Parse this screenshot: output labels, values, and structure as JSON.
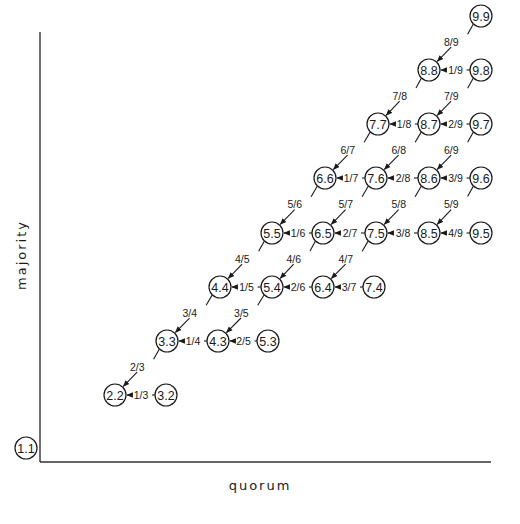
{
  "axes": {
    "x_label": "quorum",
    "y_label": "majority"
  },
  "nodes": [
    {
      "id": "1.1",
      "label": "1.1",
      "x": 26,
      "y": 448
    },
    {
      "id": "2.2",
      "label": "2.2",
      "x": 115,
      "y": 395
    },
    {
      "id": "3.2",
      "label": "3.2",
      "x": 166,
      "y": 395
    },
    {
      "id": "3.3",
      "label": "3.3",
      "x": 167,
      "y": 341
    },
    {
      "id": "4.3",
      "label": "4.3",
      "x": 218,
      "y": 341
    },
    {
      "id": "5.3",
      "label": "5.3",
      "x": 268,
      "y": 341
    },
    {
      "id": "4.4",
      "label": "4.4",
      "x": 220,
      "y": 287
    },
    {
      "id": "5.4",
      "label": "5.4",
      "x": 272,
      "y": 287
    },
    {
      "id": "6.4",
      "label": "6.4",
      "x": 323,
      "y": 287
    },
    {
      "id": "7.4",
      "label": "7.4",
      "x": 374,
      "y": 287
    },
    {
      "id": "5.5",
      "label": "5.5",
      "x": 272,
      "y": 233
    },
    {
      "id": "6.5",
      "label": "6.5",
      "x": 323,
      "y": 233
    },
    {
      "id": "7.5",
      "label": "7.5",
      "x": 376,
      "y": 233
    },
    {
      "id": "8.5",
      "label": "8.5",
      "x": 429,
      "y": 233
    },
    {
      "id": "9.5",
      "label": "9.5",
      "x": 481,
      "y": 233
    },
    {
      "id": "6.6",
      "label": "6.6",
      "x": 325,
      "y": 178
    },
    {
      "id": "7.6",
      "label": "7.6",
      "x": 376,
      "y": 178
    },
    {
      "id": "8.6",
      "label": "8.6",
      "x": 429,
      "y": 178
    },
    {
      "id": "9.6",
      "label": "9.6",
      "x": 481,
      "y": 178
    },
    {
      "id": "7.7",
      "label": "7.7",
      "x": 378,
      "y": 124
    },
    {
      "id": "8.7",
      "label": "8.7",
      "x": 429,
      "y": 124
    },
    {
      "id": "9.7",
      "label": "9.7",
      "x": 481,
      "y": 124
    },
    {
      "id": "8.8",
      "label": "8.8",
      "x": 429,
      "y": 70
    },
    {
      "id": "9.8",
      "label": "9.8",
      "x": 481,
      "y": 70
    },
    {
      "id": "9.9",
      "label": "9.9",
      "x": 481,
      "y": 16
    }
  ],
  "edges": [
    {
      "from": "3.2",
      "to": "2.2",
      "label": "1/3",
      "dir": "h"
    },
    {
      "from": "3.3",
      "to": "2.2",
      "label": "2/3",
      "dir": "d"
    },
    {
      "from": "4.3",
      "to": "3.3",
      "label": "1/4",
      "dir": "h"
    },
    {
      "from": "5.3",
      "to": "4.3",
      "label": "2/5",
      "dir": "h"
    },
    {
      "from": "4.4",
      "to": "3.3",
      "label": "3/4",
      "dir": "d"
    },
    {
      "from": "5.4",
      "to": "4.3",
      "label": "3/5",
      "dir": "d"
    },
    {
      "from": "5.4",
      "to": "4.4",
      "label": "1/5",
      "dir": "h"
    },
    {
      "from": "6.4",
      "to": "5.4",
      "label": "2/6",
      "dir": "h"
    },
    {
      "from": "7.4",
      "to": "6.4",
      "label": "3/7",
      "dir": "h"
    },
    {
      "from": "5.5",
      "to": "4.4",
      "label": "4/5",
      "dir": "d"
    },
    {
      "from": "6.5",
      "to": "5.4",
      "label": "4/6",
      "dir": "d"
    },
    {
      "from": "7.5",
      "to": "6.4",
      "label": "4/7",
      "dir": "d"
    },
    {
      "from": "6.5",
      "to": "5.5",
      "label": "1/6",
      "dir": "h"
    },
    {
      "from": "7.5",
      "to": "6.5",
      "label": "2/7",
      "dir": "h"
    },
    {
      "from": "8.5",
      "to": "7.5",
      "label": "3/8",
      "dir": "h"
    },
    {
      "from": "9.5",
      "to": "8.5",
      "label": "4/9",
      "dir": "h"
    },
    {
      "from": "6.6",
      "to": "5.5",
      "label": "5/6",
      "dir": "d"
    },
    {
      "from": "7.6",
      "to": "6.5",
      "label": "5/7",
      "dir": "d"
    },
    {
      "from": "8.6",
      "to": "7.5",
      "label": "5/8",
      "dir": "d"
    },
    {
      "from": "9.6",
      "to": "8.5",
      "label": "5/9",
      "dir": "d"
    },
    {
      "from": "7.6",
      "to": "6.6",
      "label": "1/7",
      "dir": "h"
    },
    {
      "from": "8.6",
      "to": "7.6",
      "label": "2/8",
      "dir": "h"
    },
    {
      "from": "9.6",
      "to": "8.6",
      "label": "3/9",
      "dir": "h"
    },
    {
      "from": "7.7",
      "to": "6.6",
      "label": "6/7",
      "dir": "d"
    },
    {
      "from": "8.7",
      "to": "7.6",
      "label": "6/8",
      "dir": "d"
    },
    {
      "from": "9.7",
      "to": "8.6",
      "label": "6/9",
      "dir": "d"
    },
    {
      "from": "8.7",
      "to": "7.7",
      "label": "1/8",
      "dir": "h"
    },
    {
      "from": "9.7",
      "to": "8.7",
      "label": "2/9",
      "dir": "h"
    },
    {
      "from": "8.8",
      "to": "7.7",
      "label": "7/8",
      "dir": "d"
    },
    {
      "from": "9.8",
      "to": "8.7",
      "label": "7/9",
      "dir": "d"
    },
    {
      "from": "9.8",
      "to": "8.8",
      "label": "1/9",
      "dir": "h"
    },
    {
      "from": "9.9",
      "to": "8.8",
      "label": "8/9",
      "dir": "d"
    }
  ]
}
